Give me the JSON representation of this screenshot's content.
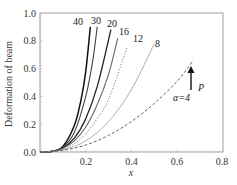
{
  "chart_data": {
    "type": "line",
    "title": "",
    "xlabel": "x",
    "ylabel": "Deformation of beam",
    "xlim": [
      0.0,
      0.8
    ],
    "ylim": [
      0.0,
      1.0
    ],
    "xticks": [
      "0.2",
      "0.4",
      "0.6",
      "0.8"
    ],
    "yticks": [
      "0.0",
      "0.2",
      "0.4",
      "0.6",
      "0.8",
      "1.0"
    ],
    "grid": false,
    "legend": "inline curve labels",
    "annotations": [
      {
        "text": "P",
        "type": "upward arrow",
        "x": 0.66,
        "y": 0.55
      },
      {
        "text": "α=4",
        "x": 0.6,
        "y": 0.4
      }
    ],
    "series": [
      {
        "name": "40",
        "style": "solid",
        "color": "#111111",
        "x": [
          0,
          0.05,
          0.1,
          0.15,
          0.18,
          0.2,
          0.22
        ],
        "y": [
          0,
          0.004,
          0.04,
          0.19,
          0.38,
          0.58,
          0.9
        ]
      },
      {
        "name": "30",
        "style": "solid",
        "color": "#444444",
        "x": [
          0,
          0.05,
          0.1,
          0.15,
          0.2,
          0.23,
          0.25
        ],
        "y": [
          0,
          0.004,
          0.035,
          0.14,
          0.4,
          0.65,
          0.9
        ]
      },
      {
        "name": "20",
        "style": "solid",
        "color": "#222222",
        "x": [
          0,
          0.05,
          0.1,
          0.15,
          0.2,
          0.25,
          0.31
        ],
        "y": [
          0,
          0.004,
          0.03,
          0.1,
          0.24,
          0.47,
          0.88
        ]
      },
      {
        "name": "16",
        "style": "solid",
        "color": "#666666",
        "x": [
          0,
          0.05,
          0.1,
          0.15,
          0.2,
          0.25,
          0.3,
          0.34
        ],
        "y": [
          0,
          0.003,
          0.025,
          0.08,
          0.18,
          0.34,
          0.56,
          0.82
        ]
      },
      {
        "name": "12",
        "style": "dotted",
        "color": "#888888",
        "x": [
          0,
          0.05,
          0.1,
          0.15,
          0.2,
          0.25,
          0.3,
          0.38
        ],
        "y": [
          0,
          0.003,
          0.02,
          0.06,
          0.13,
          0.24,
          0.38,
          0.75
        ]
      },
      {
        "name": "8",
        "style": "solid-light",
        "color": "#999999",
        "x": [
          0,
          0.1,
          0.2,
          0.3,
          0.4,
          0.5
        ],
        "y": [
          0,
          0.015,
          0.08,
          0.22,
          0.45,
          0.78
        ]
      },
      {
        "name": "4",
        "style": "dashed",
        "color": "#555555",
        "x": [
          0,
          0.1,
          0.2,
          0.3,
          0.4,
          0.5,
          0.6,
          0.67
        ],
        "y": [
          0,
          0.012,
          0.05,
          0.12,
          0.22,
          0.35,
          0.51,
          0.66
        ]
      }
    ]
  },
  "labels": {
    "l40": "40",
    "l30": "30",
    "l20": "20",
    "l16": "16",
    "l12": "12",
    "l8": "8",
    "alpha": "α=4",
    "P": "P",
    "xlabel": "x",
    "ylabel": "Deformation of beam"
  }
}
